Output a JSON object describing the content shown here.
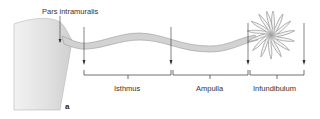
{
  "diagram": {
    "title_label": "Pars intramuralis",
    "panel_letter": "a",
    "segments": [
      {
        "label": "Isthmus"
      },
      {
        "label": "Ampulla"
      },
      {
        "label": "Infundibulum"
      }
    ],
    "colors": {
      "tube_fill": "#d2d2d2",
      "tube_stroke": "#9a9a9a",
      "uterus_fill": "#e2e2e2",
      "line": "#333333"
    }
  }
}
